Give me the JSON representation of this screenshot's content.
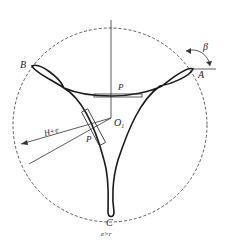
{
  "diagram": {
    "labels": {
      "point_a": "A",
      "point_b": "B",
      "point_c": "C",
      "center": "O",
      "center_sub": "1",
      "angle": "β",
      "force_top": "P",
      "force_left": "P",
      "radius": "H+e",
      "condition": "e>r"
    },
    "colors": {
      "stroke": "#1a1a1a",
      "circle": "#333333",
      "background": "#ffffff"
    }
  }
}
